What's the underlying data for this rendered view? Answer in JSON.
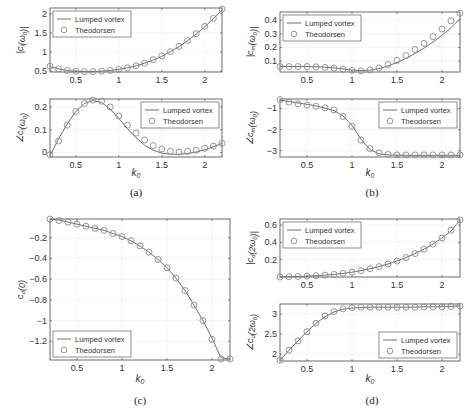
{
  "colors": {
    "line": "#6e6e6e",
    "marker": "#8a8a8a",
    "axis": "#444444",
    "grid": "#ececec",
    "text": "#333333"
  },
  "legend": {
    "line_label": "Lumped vortex",
    "marker_label": "Theodorsen"
  },
  "captions": {
    "a": "(a)",
    "b": "(b)",
    "c": "(c)",
    "d": "(d)"
  },
  "chart_data": [
    {
      "id": "a_top",
      "panel": "a",
      "type": "line",
      "ylabel": "|c_l(ω_0)|",
      "xlabel": "",
      "xlim": [
        0.2,
        2.2
      ],
      "ylim": [
        0.48,
        2.15
      ],
      "xticks": [
        0.5,
        1,
        1.5,
        2
      ],
      "yticks": [
        0.5,
        1,
        1.5,
        2
      ],
      "legend_position": "upper-left",
      "grid": true,
      "x": [
        0.2,
        0.3,
        0.4,
        0.5,
        0.6,
        0.7,
        0.8,
        0.9,
        1.0,
        1.1,
        1.2,
        1.3,
        1.4,
        1.5,
        1.6,
        1.7,
        1.8,
        1.9,
        2.0,
        2.1,
        2.2
      ],
      "series": [
        {
          "name": "Lumped vortex",
          "style": "line",
          "values": [
            0.62,
            0.56,
            0.52,
            0.5,
            0.49,
            0.49,
            0.5,
            0.52,
            0.55,
            0.59,
            0.64,
            0.71,
            0.79,
            0.89,
            1.01,
            1.14,
            1.3,
            1.47,
            1.66,
            1.87,
            2.1
          ]
        },
        {
          "name": "Theodorsen",
          "style": "marker",
          "values": [
            0.63,
            0.56,
            0.52,
            0.5,
            0.49,
            0.49,
            0.5,
            0.52,
            0.55,
            0.59,
            0.64,
            0.71,
            0.8,
            0.9,
            1.01,
            1.15,
            1.3,
            1.48,
            1.67,
            1.88,
            2.12
          ]
        }
      ]
    },
    {
      "id": "a_bottom",
      "panel": "a",
      "type": "line",
      "ylabel": "∠c_l(ω_0)",
      "xlabel": "k_0",
      "xlim": [
        0.2,
        2.2
      ],
      "ylim": [
        -0.02,
        0.235
      ],
      "xticks": [
        0.5,
        1,
        1.5,
        2
      ],
      "yticks": [
        0,
        0.1,
        0.2
      ],
      "legend_position": "upper-right",
      "grid": true,
      "x": [
        0.2,
        0.3,
        0.4,
        0.5,
        0.6,
        0.7,
        0.8,
        0.9,
        1.0,
        1.1,
        1.2,
        1.3,
        1.4,
        1.5,
        1.6,
        1.7,
        1.8,
        1.9,
        2.0,
        2.1,
        2.2
      ],
      "series": [
        {
          "name": "Lumped vortex",
          "style": "line",
          "values": [
            -0.015,
            0.06,
            0.125,
            0.18,
            0.215,
            0.228,
            0.22,
            0.19,
            0.15,
            0.105,
            0.065,
            0.032,
            0.01,
            -0.003,
            -0.008,
            -0.008,
            -0.005,
            0.002,
            0.012,
            0.025,
            0.04
          ]
        },
        {
          "name": "Theodorsen",
          "style": "marker",
          "values": [
            -0.01,
            0.05,
            0.12,
            0.18,
            0.215,
            0.23,
            0.225,
            0.2,
            0.16,
            0.12,
            0.085,
            0.055,
            0.03,
            0.015,
            0.005,
            0.002,
            0.005,
            0.01,
            0.018,
            0.028,
            0.04
          ]
        }
      ]
    },
    {
      "id": "b_top",
      "panel": "b",
      "type": "line",
      "ylabel": "|c_m(ω_0)|",
      "xlabel": "",
      "xlim": [
        0.2,
        2.2
      ],
      "ylim": [
        0.02,
        0.46
      ],
      "xticks": [
        0.5,
        1,
        1.5,
        2
      ],
      "yticks": [
        0.1,
        0.2,
        0.3,
        0.4
      ],
      "legend_position": "upper-left",
      "grid": true,
      "x": [
        0.2,
        0.3,
        0.4,
        0.5,
        0.6,
        0.7,
        0.8,
        0.9,
        1.0,
        1.1,
        1.2,
        1.3,
        1.4,
        1.5,
        1.6,
        1.7,
        1.8,
        1.9,
        2.0,
        2.1,
        2.2
      ],
      "series": [
        {
          "name": "Lumped vortex",
          "style": "line",
          "values": [
            0.06,
            0.06,
            0.06,
            0.06,
            0.058,
            0.055,
            0.05,
            0.043,
            0.035,
            0.03,
            0.033,
            0.045,
            0.065,
            0.09,
            0.12,
            0.155,
            0.195,
            0.24,
            0.29,
            0.345,
            0.41
          ]
        },
        {
          "name": "Theodorsen",
          "style": "marker",
          "values": [
            0.06,
            0.06,
            0.06,
            0.06,
            0.058,
            0.054,
            0.048,
            0.04,
            0.032,
            0.028,
            0.035,
            0.05,
            0.075,
            0.105,
            0.14,
            0.185,
            0.23,
            0.28,
            0.335,
            0.395,
            0.45
          ]
        }
      ]
    },
    {
      "id": "b_bottom",
      "panel": "b",
      "type": "line",
      "ylabel": "∠c_m(ω_0)",
      "xlabel": "k_0",
      "xlim": [
        0.2,
        2.2
      ],
      "ylim": [
        -3.3,
        -0.55
      ],
      "xticks": [
        0.5,
        1,
        1.5,
        2
      ],
      "yticks": [
        -3,
        -2,
        -1
      ],
      "legend_position": "upper-right",
      "grid": true,
      "x": [
        0.2,
        0.3,
        0.4,
        0.5,
        0.6,
        0.7,
        0.8,
        0.9,
        1.0,
        1.1,
        1.2,
        1.3,
        1.4,
        1.5,
        1.6,
        1.7,
        1.8,
        1.9,
        2.0,
        2.1,
        2.2
      ],
      "series": [
        {
          "name": "Lumped vortex",
          "style": "line",
          "values": [
            -0.6,
            -0.67,
            -0.74,
            -0.8,
            -0.88,
            -0.98,
            -1.1,
            -1.35,
            -1.8,
            -2.45,
            -2.95,
            -3.15,
            -3.2,
            -3.21,
            -3.22,
            -3.22,
            -3.22,
            -3.22,
            -3.22,
            -3.22,
            -3.22
          ]
        },
        {
          "name": "Theodorsen",
          "style": "marker",
          "values": [
            -0.58,
            -0.7,
            -0.78,
            -0.84,
            -0.9,
            -0.97,
            -1.07,
            -1.38,
            -1.85,
            -2.5,
            -2.9,
            -3.1,
            -3.18,
            -3.2,
            -3.2,
            -3.2,
            -3.2,
            -3.2,
            -3.2,
            -3.2,
            -3.2
          ]
        }
      ]
    },
    {
      "id": "c",
      "panel": "c",
      "type": "line",
      "ylabel": "c_d(0)",
      "xlabel": "k_0",
      "xlim": [
        0.2,
        2.2
      ],
      "ylim": [
        -1.38,
        -0.02
      ],
      "xticks": [
        0.5,
        1,
        1.5,
        2
      ],
      "yticks": [
        -1.2,
        -1,
        -0.8,
        -0.6,
        -0.4,
        -0.2
      ],
      "legend_position": "lower-left",
      "grid": true,
      "x": [
        0.2,
        0.3,
        0.4,
        0.5,
        0.6,
        0.7,
        0.8,
        0.9,
        1.0,
        1.1,
        1.2,
        1.3,
        1.4,
        1.5,
        1.6,
        1.7,
        1.8,
        1.9,
        2.0,
        2.1,
        2.2
      ],
      "series": [
        {
          "name": "Lumped vortex",
          "style": "line",
          "values": [
            -0.02,
            -0.03,
            -0.05,
            -0.07,
            -0.09,
            -0.11,
            -0.13,
            -0.16,
            -0.19,
            -0.23,
            -0.28,
            -0.34,
            -0.41,
            -0.49,
            -0.59,
            -0.71,
            -0.85,
            -1.0,
            -1.17,
            -1.36,
            -1.37
          ]
        },
        {
          "name": "Theodorsen",
          "style": "marker",
          "values": [
            -0.02,
            -0.035,
            -0.05,
            -0.07,
            -0.09,
            -0.11,
            -0.13,
            -0.16,
            -0.19,
            -0.23,
            -0.28,
            -0.34,
            -0.41,
            -0.49,
            -0.59,
            -0.71,
            -0.85,
            -1.0,
            -1.18,
            -1.37,
            -1.37
          ]
        }
      ]
    },
    {
      "id": "d_top",
      "panel": "d",
      "type": "line",
      "ylabel": "|c_d(2ω_0)|",
      "xlabel": "",
      "xlim": [
        0.2,
        2.2
      ],
      "ylim": [
        0.0,
        0.67
      ],
      "xticks": [
        0.5,
        1,
        1.5,
        2
      ],
      "yticks": [
        0.2,
        0.4,
        0.6
      ],
      "legend_position": "upper-left",
      "grid": true,
      "x": [
        0.2,
        0.3,
        0.4,
        0.5,
        0.6,
        0.7,
        0.8,
        0.9,
        1.0,
        1.1,
        1.2,
        1.3,
        1.4,
        1.5,
        1.6,
        1.7,
        1.8,
        1.9,
        2.0,
        2.1,
        2.2
      ],
      "series": [
        {
          "name": "Lumped vortex",
          "style": "line",
          "values": [
            0.0,
            0.003,
            0.006,
            0.01,
            0.015,
            0.022,
            0.03,
            0.042,
            0.056,
            0.074,
            0.095,
            0.12,
            0.15,
            0.185,
            0.225,
            0.27,
            0.32,
            0.38,
            0.45,
            0.53,
            0.66
          ]
        },
        {
          "name": "Theodorsen",
          "style": "marker",
          "values": [
            0.0,
            0.003,
            0.006,
            0.01,
            0.015,
            0.022,
            0.03,
            0.042,
            0.056,
            0.074,
            0.095,
            0.12,
            0.15,
            0.185,
            0.225,
            0.27,
            0.32,
            0.38,
            0.45,
            0.54,
            0.66
          ]
        }
      ]
    },
    {
      "id": "d_bottom",
      "panel": "d",
      "type": "line",
      "ylabel": "∠c_d(2ω_0)",
      "xlabel": "k_0",
      "xlim": [
        0.2,
        2.2
      ],
      "ylim": [
        1.83,
        3.25
      ],
      "xticks": [
        0.5,
        1,
        1.5,
        2
      ],
      "yticks": [
        2,
        2.5,
        3
      ],
      "legend_position": "lower-right",
      "grid": true,
      "x": [
        0.2,
        0.3,
        0.4,
        0.5,
        0.6,
        0.7,
        0.8,
        0.9,
        1.0,
        1.1,
        1.2,
        1.3,
        1.4,
        1.5,
        1.6,
        1.7,
        1.8,
        1.9,
        2.0,
        2.1,
        2.2
      ],
      "series": [
        {
          "name": "Lumped vortex",
          "style": "line",
          "values": [
            1.85,
            2.1,
            2.33,
            2.56,
            2.77,
            2.93,
            3.05,
            3.12,
            3.15,
            3.16,
            3.17,
            3.17,
            3.17,
            3.17,
            3.17,
            3.17,
            3.18,
            3.18,
            3.18,
            3.19,
            3.2
          ]
        },
        {
          "name": "Theodorsen",
          "style": "marker",
          "values": [
            1.85,
            2.1,
            2.33,
            2.56,
            2.77,
            2.95,
            3.06,
            3.13,
            3.16,
            3.17,
            3.17,
            3.17,
            3.17,
            3.17,
            3.17,
            3.17,
            3.18,
            3.18,
            3.18,
            3.19,
            3.2
          ]
        }
      ]
    }
  ]
}
